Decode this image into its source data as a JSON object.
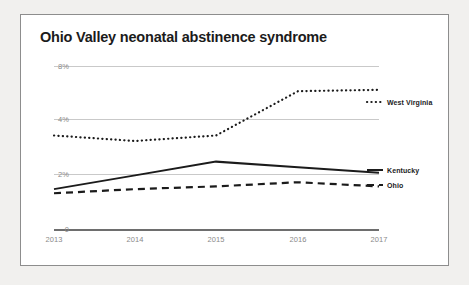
{
  "chart_data": {
    "type": "line",
    "title": "Ohio Valley neonatal abstinence syndrome",
    "xlabel": "",
    "ylabel": "",
    "x": [
      "2013",
      "2014",
      "2015",
      "2016",
      "2017"
    ],
    "categories": [
      "2013",
      "2014",
      "2015",
      "2016",
      "2017"
    ],
    "ytick_labels": [
      "8%",
      "4%",
      "2%",
      "0"
    ],
    "ytick_values": [
      8,
      4,
      2,
      0
    ],
    "ylim": [
      0,
      8
    ],
    "grid": "horizontal",
    "legend_position": "right-inline",
    "series": [
      {
        "name": "West Virginia",
        "style": "dotted",
        "color": "#1b1b1b",
        "values": [
          3.4,
          3.2,
          3.4,
          6.1,
          6.2
        ]
      },
      {
        "name": "Kentucky",
        "style": "solid",
        "color": "#1b1b1b",
        "values": [
          1.45,
          1.95,
          2.45,
          2.25,
          2.05
        ]
      },
      {
        "name": "Ohio",
        "style": "dashed",
        "color": "#1b1b1b",
        "values": [
          1.3,
          1.45,
          1.55,
          1.7,
          1.55
        ]
      }
    ]
  },
  "axis": {
    "ticks_y": [
      {
        "label": "8%",
        "top": 47
      },
      {
        "label": "4%",
        "top": 100
      },
      {
        "label": "2%",
        "top": 155
      },
      {
        "label": "0",
        "top": 210
      }
    ],
    "ticks_x": [
      {
        "label": "2013",
        "left": 33
      },
      {
        "label": "2014",
        "left": 114
      },
      {
        "label": "2015",
        "left": 195
      },
      {
        "label": "2016",
        "left": 277
      },
      {
        "label": "2017",
        "left": 358
      }
    ]
  },
  "legend": [
    {
      "label": "West Virginia",
      "top": 84,
      "left": 366
    },
    {
      "label": "Kentucky",
      "top": 152,
      "left": 366
    },
    {
      "label": "Ohio",
      "top": 167,
      "left": 366
    }
  ],
  "colors": {
    "page_background": "#f1f0ee",
    "card_background": "#ffffff",
    "card_border": "#8d8d8d",
    "gridline": "#c9c9c9",
    "axis_line": "#6e6e6e",
    "tick_text": "#8a8a8a",
    "ink": "#1b1b1b"
  }
}
